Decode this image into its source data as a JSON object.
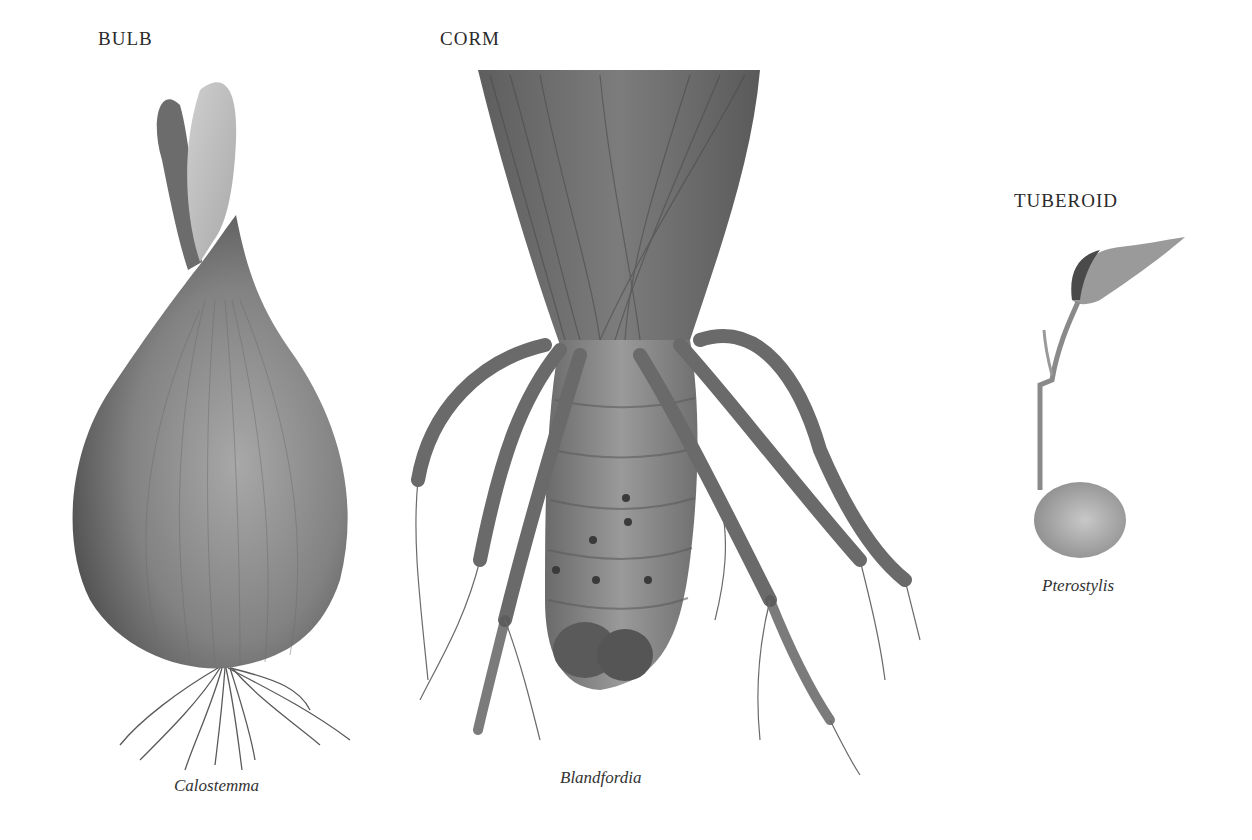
{
  "plate": {
    "specimens": [
      {
        "type_label": "BULB",
        "genus": "Calostemma"
      },
      {
        "type_label": "CORM",
        "genus": "Blandfordia"
      },
      {
        "type_label": "TUBEROID",
        "genus": "Pterostylis"
      }
    ]
  },
  "colors": {
    "background": "#ffffff",
    "ink": "#2a2a2a",
    "dark_wash": "#4a4a4a",
    "mid_wash": "#7a7a7a",
    "light_wash": "#b8b8b8"
  }
}
